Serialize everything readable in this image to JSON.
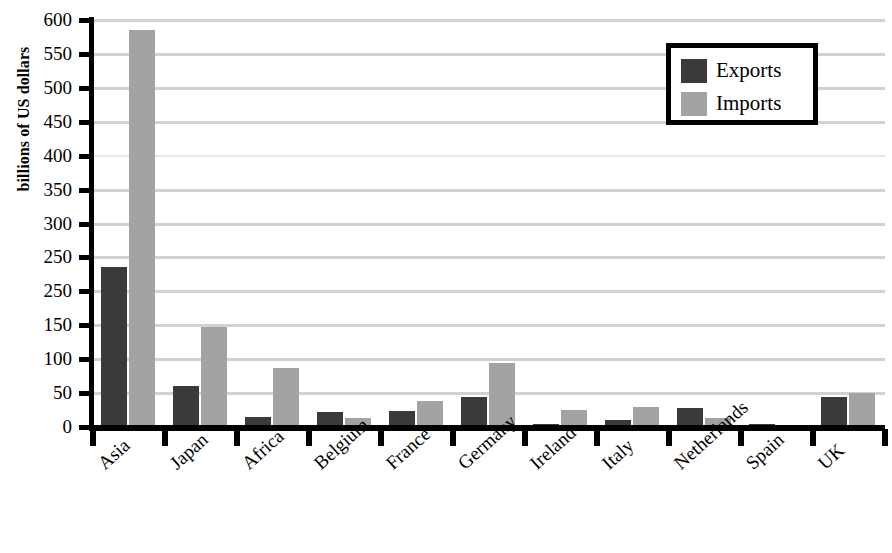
{
  "chart_data": {
    "type": "bar",
    "title": "",
    "xlabel": "",
    "ylabel": "billions of US dollars",
    "ylim": [
      0,
      600
    ],
    "ytick_values": [
      600,
      550,
      500,
      450,
      400,
      350,
      300,
      250,
      200,
      150,
      100,
      50,
      0
    ],
    "ytick_labels": [
      "600",
      "550",
      "500",
      "450",
      "400",
      "350",
      "300",
      "250",
      "250",
      "150",
      "100",
      "50",
      "0"
    ],
    "grid": true,
    "grid_axis": "y",
    "legend_position": "top-right",
    "categories": [
      "Asia",
      "Japan",
      "Africa",
      "Belgium",
      "France",
      "Germany",
      "Ireland",
      "Italy",
      "Netherlands",
      "Spain",
      "UK"
    ],
    "series": [
      {
        "name": "Exports",
        "color": "#3a3a3a",
        "values": [
          236,
          61,
          15,
          22,
          24,
          44,
          4,
          10,
          28,
          4,
          44
        ]
      },
      {
        "name": "Imports",
        "color": "#a3a3a3",
        "values": [
          585,
          147,
          87,
          13,
          39,
          95,
          25,
          30,
          13,
          3,
          50
        ]
      }
    ]
  },
  "legend": {
    "entries": [
      {
        "label": "Exports",
        "swatch": "exports"
      },
      {
        "label": "Imports",
        "swatch": "imports"
      }
    ]
  },
  "colors": {
    "exports": "#3a3a3a",
    "imports": "#a3a3a3",
    "gridline": "#d2d2d2",
    "axis": "#000000",
    "background": "#ffffff"
  }
}
